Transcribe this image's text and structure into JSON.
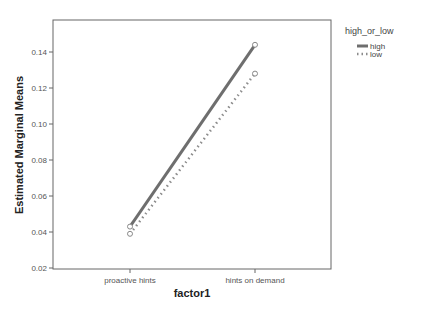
{
  "chart_data": {
    "type": "line",
    "title": "",
    "xlabel": "factor1",
    "ylabel": "Estimated Marginal Means",
    "categories": [
      "proactive hints",
      "hints on demand"
    ],
    "series": [
      {
        "name": "high",
        "values": [
          0.043,
          0.144
        ],
        "style": "solid",
        "color": "#6e6e6e"
      },
      {
        "name": "low",
        "values": [
          0.039,
          0.128
        ],
        "style": "dotted",
        "color": "#8c8c8c"
      }
    ],
    "yticks": [
      "0.02",
      "0.04",
      "0.06",
      "0.08",
      "0.10",
      "0.12",
      "0.14"
    ],
    "ylim": [
      0.02,
      0.15
    ],
    "grid": false,
    "legend": {
      "title": "high_or_low",
      "position": "right-top",
      "entries": [
        "high",
        "low"
      ]
    }
  }
}
